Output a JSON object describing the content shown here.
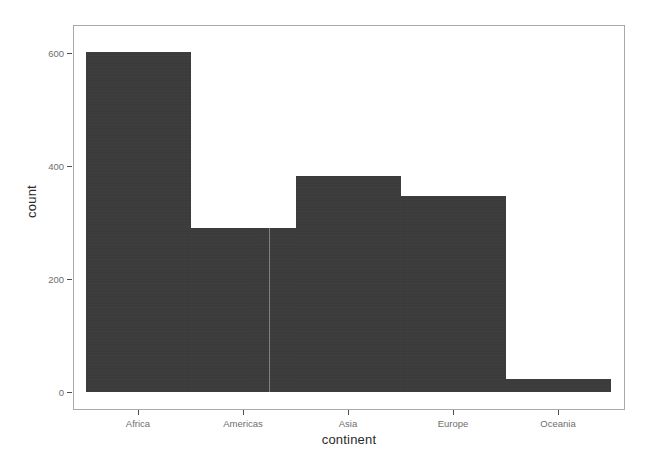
{
  "chart_data": {
    "type": "bar",
    "title": "",
    "xlabel": "continent",
    "ylabel": "count",
    "categories": [
      "Africa",
      "Americas",
      "Asia",
      "Europe",
      "Oceania"
    ],
    "values": [
      624,
      300,
      396,
      360,
      24
    ],
    "ylim": [
      0,
      660
    ],
    "yticks": [
      0,
      200,
      400,
      600
    ],
    "ytick_labels": [
      "0",
      "200",
      "400",
      "600"
    ],
    "grid": false,
    "legend": "none",
    "bar_color": "#3a3a3a",
    "panel_border_color": "#a9a9a9",
    "background_color": "#ffffff",
    "axis_text_color": "#6e6e6e",
    "axis_title_color": "#2b2b2b"
  }
}
